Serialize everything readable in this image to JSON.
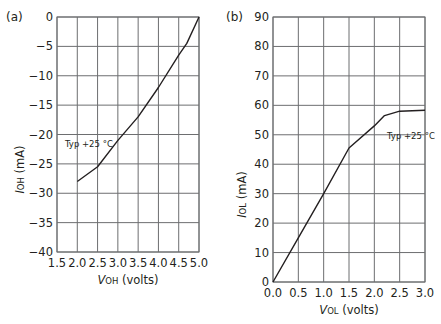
{
  "chart_data": [
    {
      "type": "line",
      "panel_label": "(a)",
      "title": "",
      "xlabel_italic": "V",
      "xlabel_sub": "OH",
      "xlabel_rest": " (volts)",
      "ylabel_italic": "I",
      "ylabel_sub": "OH",
      "ylabel_rest": " (mA)",
      "xlim": [
        1.5,
        5.0
      ],
      "ylim": [
        -40,
        0
      ],
      "xticks": [
        "1.5",
        "2.0",
        "2.5",
        "3.0",
        "3.5",
        "4.0",
        "4.5",
        "5.0"
      ],
      "yticks": [
        "0",
        "−5",
        "−10",
        "−15",
        "−20",
        "−25",
        "−30",
        "−35",
        "−40"
      ],
      "grid": true,
      "annotation": "Typ +25 °C",
      "series": [
        {
          "name": "Typ +25 °C",
          "x": [
            2.0,
            2.5,
            3.0,
            3.5,
            4.0,
            4.5,
            4.7,
            5.0
          ],
          "y": [
            -28,
            -25.5,
            -21,
            -17,
            -12,
            -6.5,
            -4.5,
            0
          ]
        }
      ]
    },
    {
      "type": "line",
      "panel_label": "(b)",
      "title": "",
      "xlabel_italic": "V",
      "xlabel_sub": "OL",
      "xlabel_rest": " (volts)",
      "ylabel_italic": "I",
      "ylabel_sub": "OL",
      "ylabel_rest": " (mA)",
      "xlim": [
        0.0,
        3.0
      ],
      "ylim": [
        0,
        90
      ],
      "xticks": [
        "0.0",
        "0.5",
        "1.0",
        "1.5",
        "2.0",
        "2.5",
        "3.0"
      ],
      "yticks": [
        "90",
        "80",
        "70",
        "60",
        "50",
        "40",
        "30",
        "20",
        "10",
        "0"
      ],
      "grid": true,
      "annotation": "Typ +25 °C",
      "series": [
        {
          "name": "Typ +25 °C",
          "x": [
            0.0,
            0.5,
            1.0,
            1.5,
            2.0,
            2.2,
            2.5,
            3.0
          ],
          "y": [
            0,
            15,
            30,
            45.5,
            53,
            56.5,
            58,
            58.3
          ]
        }
      ]
    }
  ]
}
